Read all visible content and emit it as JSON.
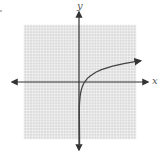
{
  "chart_data": {
    "type": "line",
    "title": "",
    "xlabel": "x",
    "ylabel": "y",
    "xlim": [
      -10,
      10
    ],
    "ylim": [
      -10,
      10
    ],
    "grid": true,
    "grid_step": 1,
    "function": "y = ln(x)",
    "series": [
      {
        "name": "logarithmic curve",
        "x": [
          0.05,
          0.1,
          0.2,
          0.3,
          0.5,
          0.75,
          1,
          1.5,
          2,
          3,
          4,
          5,
          6,
          7,
          8,
          9,
          10,
          11
        ],
        "y": [
          -3.0,
          -2.3,
          -1.61,
          -1.2,
          -0.69,
          -0.29,
          0,
          0.41,
          0.69,
          1.1,
          1.39,
          1.61,
          1.79,
          1.95,
          2.08,
          2.2,
          2.3,
          2.4
        ]
      }
    ],
    "annotations": [
      "vertical asymptote at x = 0 (curve descends along y-axis)",
      "arrowheads on both axes and on curve's right end"
    ]
  },
  "axes": {
    "x_label": "x",
    "y_label": "y"
  },
  "colors": {
    "grid_bg": "#d9d9d9",
    "grid_line": "#f2f2f2",
    "axis": "#333333",
    "curve": "#444444"
  }
}
